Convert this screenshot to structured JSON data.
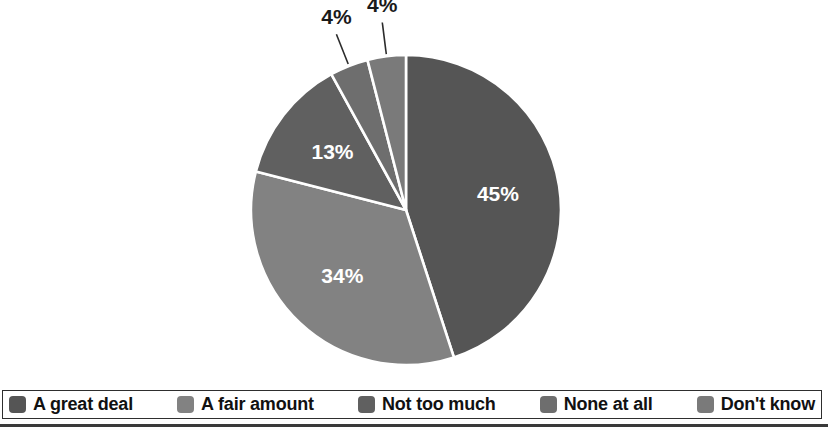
{
  "chart_data": {
    "type": "pie",
    "title": "",
    "labels": [
      "A great deal",
      "A fair amount",
      "Not too much",
      "None at all",
      "Don't know"
    ],
    "values": [
      45,
      34,
      13,
      4,
      4
    ],
    "value_labels": [
      "45%",
      "34%",
      "13%",
      "4%",
      "4%"
    ],
    "colors": [
      "#555555",
      "#828282",
      "#606060",
      "#6e6e6e",
      "#7a7a7a"
    ],
    "start_angle_deg": 0,
    "direction": "clockwise",
    "legend_position": "bottom",
    "grid": false,
    "label_positions": [
      "inside",
      "inside",
      "inside",
      "outside",
      "outside"
    ]
  },
  "pie": {
    "slices": [
      {
        "label": "A great deal",
        "value_label": "45%",
        "value": 45,
        "color": "#555555",
        "label_color": "#ffffff",
        "placement": "inside"
      },
      {
        "label": "A fair amount",
        "value_label": "34%",
        "value": 34,
        "color": "#828282",
        "label_color": "#ffffff",
        "placement": "inside"
      },
      {
        "label": "Not too much",
        "value_label": "13%",
        "value": 13,
        "color": "#606060",
        "label_color": "#ffffff",
        "placement": "inside"
      },
      {
        "label": "None at all",
        "value_label": "4%",
        "value": 4,
        "color": "#6e6e6e",
        "label_color": "#1a1a1a",
        "placement": "outside"
      },
      {
        "label": "Don't know",
        "value_label": "4%",
        "value": 4,
        "color": "#7a7a7a",
        "label_color": "#1a1a1a",
        "placement": "outside"
      }
    ]
  },
  "legend": {
    "items": [
      {
        "label": "A great deal",
        "color": "#555555"
      },
      {
        "label": "A fair amount",
        "color": "#828282"
      },
      {
        "label": "Not too much",
        "color": "#606060"
      },
      {
        "label": "None at all",
        "color": "#6e6e6e"
      },
      {
        "label": "Don't know",
        "color": "#7a7a7a"
      }
    ]
  }
}
